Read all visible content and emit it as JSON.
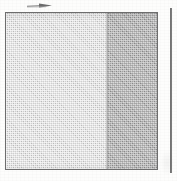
{
  "figure": {
    "background_color": "#fdfdfc"
  },
  "annotation": {
    "name": "right-pointing arrow",
    "icon": "arrow-right-icon",
    "direction": "right",
    "color": "#6b6b6b",
    "label": ""
  },
  "panel": {
    "name": "halftone panel",
    "border_color": "#6d6d6d",
    "regions": [
      {
        "id": "light",
        "label": "",
        "fill": "halftone-dither",
        "tone": "light",
        "color": "#cfcfcf",
        "share_percent": 67
      },
      {
        "id": "dark",
        "label": "",
        "fill": "halftone-dither",
        "tone": "dark",
        "color": "#a2a2a2",
        "share_percent": 33
      }
    ]
  },
  "rule": {
    "name": "vertical rule",
    "orientation": "vertical",
    "color": "#5e5e5e",
    "label": ""
  }
}
